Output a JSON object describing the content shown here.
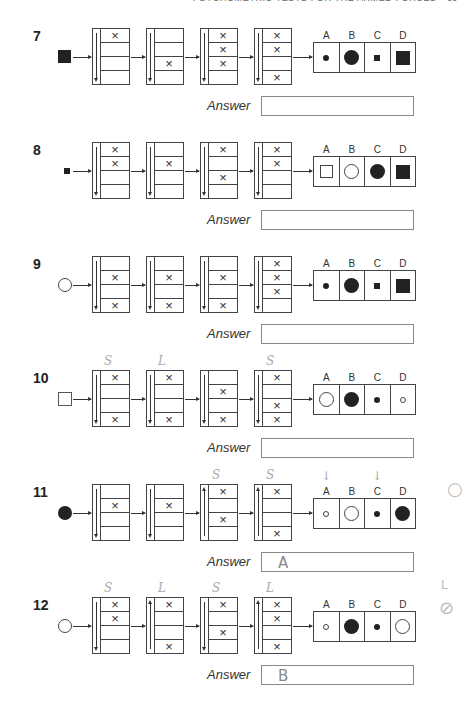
{
  "header": {
    "running_title": "PSYCHOMETRIC TESTS FOR THE ARMED FORCES",
    "page_number": "33"
  },
  "answer_label": "Answer",
  "option_labels": [
    "A",
    "B",
    "C",
    "D"
  ],
  "questions": [
    {
      "number": "7",
      "top": 28,
      "input_shape": "square-filled-large",
      "gates": [
        {
          "direction": "down",
          "cells": [
            "×",
            "",
            "",
            ""
          ]
        },
        {
          "direction": "down",
          "cells": [
            "",
            "",
            "×",
            ""
          ]
        },
        {
          "direction": "down",
          "cells": [
            "×",
            "×",
            "×",
            ""
          ]
        },
        {
          "direction": "down",
          "cells": [
            "×",
            "×",
            "",
            "×"
          ]
        }
      ],
      "options": [
        "dot-small-filled",
        "circle-large-filled",
        "square-small-filled",
        "square-large-filled"
      ],
      "answer": "",
      "handwritten_notes": []
    },
    {
      "number": "8",
      "top": 142,
      "input_shape": "square-filled-small",
      "gates": [
        {
          "direction": "down",
          "cells": [
            "×",
            "×",
            "",
            ""
          ]
        },
        {
          "direction": "down",
          "cells": [
            "",
            "×",
            "",
            ""
          ]
        },
        {
          "direction": "down",
          "cells": [
            "×",
            "",
            "×",
            ""
          ]
        },
        {
          "direction": "down",
          "cells": [
            "×",
            "×",
            "",
            ""
          ]
        }
      ],
      "options": [
        "square-large-open",
        "circle-large-open",
        "circle-large-filled",
        "square-large-filled"
      ],
      "answer": "",
      "handwritten_notes": []
    },
    {
      "number": "9",
      "top": 256,
      "input_shape": "circle-open",
      "gates": [
        {
          "direction": "down",
          "cells": [
            "",
            "×",
            "",
            "×"
          ]
        },
        {
          "direction": "down",
          "cells": [
            "",
            "×",
            "",
            "×"
          ]
        },
        {
          "direction": "down",
          "cells": [
            "",
            "×",
            "",
            "×"
          ]
        },
        {
          "direction": "down",
          "cells": [
            "×",
            "×",
            "×",
            ""
          ]
        }
      ],
      "options": [
        "dot-small-filled",
        "circle-large-filled",
        "square-small-filled",
        "square-large-filled"
      ],
      "answer": "",
      "handwritten_notes": []
    },
    {
      "number": "10",
      "top": 370,
      "input_shape": "square-open",
      "gates": [
        {
          "direction": "down",
          "cells": [
            "×",
            "",
            "",
            "×"
          ]
        },
        {
          "direction": "down",
          "cells": [
            "×",
            "",
            "",
            "×"
          ]
        },
        {
          "direction": "down",
          "cells": [
            "",
            "×",
            "",
            "×"
          ]
        },
        {
          "direction": "down",
          "cells": [
            "×",
            "",
            "×",
            "×"
          ]
        }
      ],
      "options": [
        "circle-large-open",
        "circle-large-filled",
        "dot-small-filled",
        "circle-small-open"
      ],
      "answer": "",
      "handwritten_notes": [
        "S",
        "L",
        "",
        "S"
      ]
    },
    {
      "number": "11",
      "top": 484,
      "input_shape": "circle-filled",
      "gates": [
        {
          "direction": "down",
          "cells": [
            "",
            "×",
            "",
            ""
          ]
        },
        {
          "direction": "down",
          "cells": [
            "",
            "×",
            "",
            ""
          ]
        },
        {
          "direction": "up",
          "cells": [
            "×",
            "",
            "×",
            ""
          ]
        },
        {
          "direction": "up",
          "cells": [
            "×",
            "",
            "",
            "×"
          ]
        }
      ],
      "options": [
        "circle-small-open",
        "circle-large-open",
        "dot-small-filled",
        "circle-large-filled"
      ],
      "answer": "A",
      "handwritten_notes": [
        "",
        "",
        "S",
        "S"
      ],
      "handwritten_option_marks": [
        "↓",
        "",
        "↓",
        ""
      ]
    },
    {
      "number": "12",
      "top": 597,
      "input_shape": "circle-open",
      "gates": [
        {
          "direction": "down",
          "cells": [
            "×",
            "×",
            "",
            ""
          ]
        },
        {
          "direction": "up",
          "cells": [
            "×",
            "",
            "",
            "×"
          ]
        },
        {
          "direction": "down",
          "cells": [
            "×",
            "",
            "×",
            ""
          ]
        },
        {
          "direction": "up",
          "cells": [
            "×",
            "×",
            "",
            "×"
          ]
        }
      ],
      "options": [
        "circle-small-open",
        "circle-large-filled",
        "dot-small-filled",
        "circle-large-open"
      ],
      "answer": "B",
      "handwritten_notes": [
        "S",
        "L",
        "S",
        "L"
      ]
    }
  ],
  "margin_marks": [
    {
      "glyph": "○",
      "top": 478,
      "left": 447
    },
    {
      "glyph": "L",
      "top": 578,
      "left": 441
    },
    {
      "glyph": "⊘",
      "top": 597,
      "left": 439
    }
  ]
}
